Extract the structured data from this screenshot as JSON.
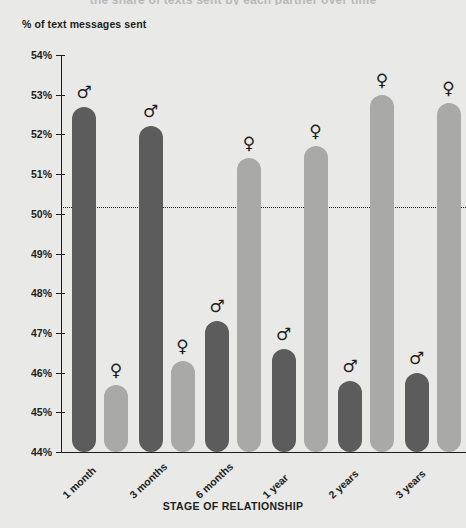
{
  "clipped_title": "the share of texts sent by each partner over time",
  "axes": {
    "y_caption": "% of text messages sent",
    "x_caption": "STAGE OF RELATIONSHIP",
    "y_ticks": [
      "54%",
      "53%",
      "52%",
      "51%",
      "50%",
      "49%",
      "48%",
      "47%",
      "46%",
      "45%",
      "44%"
    ],
    "reference_line_value": "50%"
  },
  "colors": {
    "male": "#5c5c5c",
    "female": "#a9a9a7",
    "background": "#e9e9e7",
    "ink": "#1d1d1b"
  },
  "icons": {
    "male": "♂",
    "female": "♀",
    "male_name": "mars-male-symbol-icon",
    "female_name": "venus-female-symbol-icon"
  },
  "chart_data": {
    "type": "bar",
    "title": "",
    "xlabel": "STAGE OF RELATIONSHIP",
    "ylabel": "% of text messages sent",
    "ylim": [
      44,
      54
    ],
    "yticks": [
      44,
      45,
      46,
      47,
      48,
      49,
      50,
      51,
      52,
      53,
      54
    ],
    "ytick_labels": [
      "44%",
      "45%",
      "46%",
      "47%",
      "48%",
      "49%",
      "50%",
      "51%",
      "52%",
      "53%",
      "54%"
    ],
    "grid": false,
    "legend": "none",
    "reference_lines": [
      {
        "y": 50,
        "style": "dotted",
        "label": "50%"
      }
    ],
    "categories": [
      "1 month",
      "3 months",
      "6 months",
      "1 year",
      "2 years",
      "3 years"
    ],
    "series": [
      {
        "name": "Male",
        "symbol": "♂",
        "color": "#5c5c5c",
        "values": [
          52.7,
          52.2,
          47.3,
          46.6,
          45.8,
          46.0
        ]
      },
      {
        "name": "Female",
        "symbol": "♀",
        "color": "#a9a9a7",
        "values": [
          45.7,
          46.3,
          51.4,
          51.7,
          53.0,
          52.8
        ]
      }
    ]
  }
}
